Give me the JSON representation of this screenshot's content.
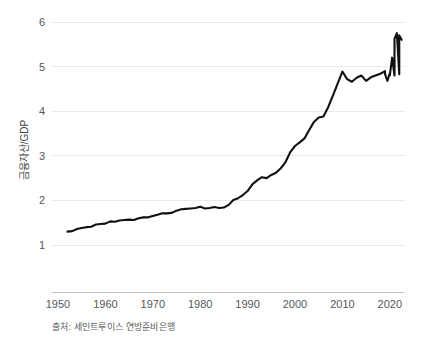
{
  "chart_data": {
    "type": "line",
    "title": "",
    "subtitle": "",
    "xlabel": "",
    "ylabel": "금융자산/GDP",
    "source_note": "출처: 세인트루이스 연방준비은행",
    "xlim": [
      1950,
      2023
    ],
    "ylim": [
      1,
      6
    ],
    "grid": true,
    "legend": "none",
    "x_tick_labels": [
      "1950",
      "1960",
      "1970",
      "1980",
      "1990",
      "2000",
      "2010",
      "2020"
    ],
    "x_ticks": [
      1950,
      1960,
      1970,
      1980,
      1990,
      2000,
      2010,
      2020
    ],
    "y_tick_labels": [
      "1",
      "2",
      "3",
      "4",
      "5",
      "6"
    ],
    "y_ticks": [
      1,
      2,
      3,
      4,
      5,
      6
    ],
    "series": [
      {
        "name": "금융자산/GDP",
        "color": "#111111",
        "x": [
          1952,
          1953,
          1954,
          1955,
          1956,
          1957,
          1958,
          1959,
          1960,
          1961,
          1962,
          1963,
          1964,
          1965,
          1966,
          1967,
          1968,
          1969,
          1970,
          1971,
          1972,
          1973,
          1974,
          1975,
          1976,
          1977,
          1978,
          1979,
          1980,
          1981,
          1982,
          1983,
          1984,
          1985,
          1986,
          1987,
          1988,
          1989,
          1990,
          1991,
          1992,
          1993,
          1994,
          1995,
          1996,
          1997,
          1998,
          1999,
          2000,
          2001,
          2002,
          2003,
          2004,
          2005,
          2006,
          2007,
          2008,
          2009,
          2010,
          2011,
          2012,
          2013,
          2014,
          2015,
          2016,
          2017,
          2018,
          2019,
          2020,
          2021,
          2022
        ],
        "values": [
          1.3,
          1.31,
          1.36,
          1.38,
          1.4,
          1.41,
          1.46,
          1.47,
          1.48,
          1.53,
          1.52,
          1.55,
          1.56,
          1.57,
          1.56,
          1.6,
          1.62,
          1.62,
          1.65,
          1.68,
          1.71,
          1.71,
          1.72,
          1.77,
          1.8,
          1.81,
          1.82,
          1.83,
          1.86,
          1.82,
          1.83,
          1.85,
          1.83,
          1.84,
          1.9,
          2.01,
          2.05,
          2.12,
          2.21,
          2.36,
          2.45,
          2.52,
          2.5,
          2.57,
          2.62,
          2.72,
          2.86,
          3.08,
          3.22,
          3.3,
          3.39,
          3.58,
          3.76,
          3.86,
          3.88,
          4.09,
          4.35,
          4.62,
          4.89,
          4.72,
          4.66,
          4.75,
          4.8,
          4.68,
          4.76,
          4.8,
          4.84,
          4.9,
          4.85,
          4.8,
          4.83
        ],
        "tail_x": [
          2019.0,
          2019.5,
          2020.0,
          2020.5,
          2021.0,
          2021.5,
          2022.0,
          2022.5
        ],
        "tail_values": [
          4.83,
          4.68,
          4.8,
          5.2,
          5.62,
          5.75,
          5.7,
          5.6
        ]
      }
    ],
    "annotations": []
  },
  "figure": {
    "background_color": "#ffffff",
    "grid_color": "#e9eaec",
    "axis_color": "#bfc1c4",
    "line_color": "#111111",
    "text_color": "#55585c"
  }
}
